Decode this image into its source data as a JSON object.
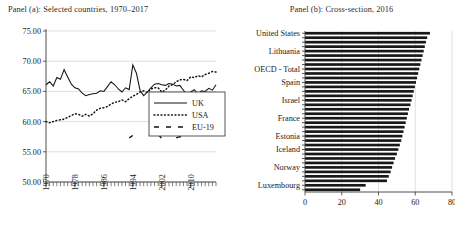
{
  "figure": {
    "panel_a": {
      "title": "Panel (a): Selected countries, 1970–2017",
      "ylabel": "",
      "xlabel": "",
      "ytick_labels": [
        "50.00",
        "55.00",
        "60.00",
        "65.00",
        "70.00",
        "75.00"
      ],
      "xtick_labels": [
        "1970",
        "1978",
        "1986",
        "1994",
        "2002",
        "2010"
      ],
      "legend": [
        {
          "label": "UK",
          "style": "solid"
        },
        {
          "label": "USA",
          "style": "dotted"
        },
        {
          "label": "EU-19",
          "style": "dashed"
        }
      ]
    },
    "panel_b": {
      "title": "Panel (b): Cross-section, 2016",
      "xtick_labels": [
        "0",
        "20",
        "40",
        "60",
        "80"
      ],
      "labelled_categories": [
        "United States",
        "Lithuania",
        "OECD - Total",
        "Spain",
        "Israel",
        "France",
        "Estonia",
        "Iceland",
        "Norway",
        "Luxembourg"
      ]
    }
  },
  "chart_data": [
    {
      "type": "line",
      "panel": "a",
      "title": "Panel (a): Selected countries, 1970–2017",
      "xlabel": "",
      "ylabel": "",
      "xlim": [
        1970,
        2017
      ],
      "ylim": [
        50.0,
        75.0
      ],
      "yticks": [
        50.0,
        55.0,
        60.0,
        65.0,
        70.0,
        75.0
      ],
      "xticks": [
        1970,
        1978,
        1986,
        1994,
        2002,
        2010
      ],
      "grid": true,
      "legend_position": "lower-right",
      "x": [
        1970,
        1971,
        1972,
        1973,
        1974,
        1975,
        1976,
        1977,
        1978,
        1979,
        1980,
        1981,
        1982,
        1983,
        1984,
        1985,
        1986,
        1987,
        1988,
        1989,
        1990,
        1991,
        1992,
        1993,
        1994,
        1995,
        1996,
        1997,
        1998,
        1999,
        2000,
        2001,
        2002,
        2003,
        2004,
        2005,
        2006,
        2007,
        2008,
        2009,
        2010,
        2011,
        2012,
        2013,
        2014,
        2015,
        2016,
        2017
      ],
      "series": [
        {
          "name": "UK",
          "style": "solid",
          "values": [
            66.1,
            66.6,
            65.9,
            67.3,
            67.0,
            68.6,
            67.4,
            66.2,
            65.6,
            65.4,
            64.7,
            64.3,
            64.5,
            64.6,
            64.7,
            65.1,
            65.0,
            65.8,
            66.6,
            66.1,
            65.4,
            64.9,
            65.6,
            65.3,
            69.4,
            68.0,
            65.2,
            64.3,
            64.9,
            65.6,
            66.2,
            66.3,
            66.1,
            66.0,
            66.3,
            66.2,
            65.9,
            66.0,
            65.2,
            64.4,
            64.9,
            65.3,
            64.6,
            65.1,
            65.0,
            65.5,
            65.2,
            66.1
          ]
        },
        {
          "name": "USA",
          "style": "dotted",
          "values": [
            60.0,
            59.8,
            60.0,
            60.2,
            60.3,
            60.4,
            60.7,
            61.0,
            61.3,
            61.2,
            60.9,
            61.2,
            60.9,
            61.3,
            61.9,
            62.2,
            62.3,
            62.5,
            62.9,
            63.2,
            63.3,
            63.6,
            63.3,
            63.8,
            64.2,
            64.5,
            64.9,
            65.1,
            64.8,
            65.4,
            65.6,
            65.6,
            64.9,
            65.2,
            65.9,
            66.1,
            66.6,
            66.9,
            67.0,
            66.8,
            67.4,
            67.3,
            67.6,
            67.4,
            67.8,
            68.0,
            68.3,
            68.2
          ]
        },
        {
          "name": "EU-19",
          "style": "dashed",
          "values": [
            null,
            null,
            null,
            null,
            null,
            null,
            null,
            null,
            null,
            null,
            null,
            null,
            null,
            null,
            null,
            null,
            null,
            null,
            null,
            null,
            null,
            null,
            null,
            57.3,
            57.7,
            null,
            null,
            null,
            null,
            null,
            null,
            57.9,
            57.2,
            null,
            null,
            null,
            57.3,
            57.5,
            57.2,
            null,
            null,
            null,
            null,
            null,
            null,
            null,
            null,
            null
          ]
        }
      ]
    },
    {
      "type": "bar",
      "orientation": "horizontal",
      "panel": "b",
      "title": "Panel (b): Cross-section, 2016",
      "xlabel": "",
      "ylabel": "",
      "xlim": [
        0,
        80
      ],
      "xticks": [
        0,
        20,
        40,
        60,
        80
      ],
      "grid": true,
      "categories": [
        "United States",
        "",
        "Lithuania",
        "",
        "OECD - Total",
        "",
        "Spain",
        "",
        "Israel",
        "",
        "France",
        "",
        "Estonia",
        "",
        "Iceland",
        "",
        "Norway",
        "",
        "Luxembourg"
      ],
      "labelled_categories": [
        "United States",
        "Lithuania",
        "OECD - Total",
        "Spain",
        "Israel",
        "France",
        "Estonia",
        "Iceland",
        "Norway",
        "Luxembourg"
      ],
      "values": [
        68.0,
        66.5,
        65.8,
        65.2,
        64.6,
        64.0,
        63.4,
        62.8,
        62.2,
        61.6,
        61.0,
        60.4,
        59.8,
        59.2,
        58.6,
        58.0,
        57.4,
        56.6,
        56.0,
        55.4,
        54.8,
        54.2,
        53.6,
        53.0,
        52.4,
        51.6,
        50.8,
        50.0,
        49.0,
        48.2,
        47.4,
        46.6,
        45.6,
        44.6,
        33.0,
        30.0
      ]
    }
  ]
}
